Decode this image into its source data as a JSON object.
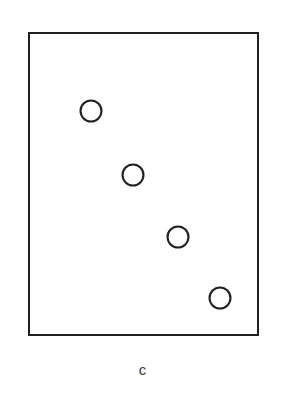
{
  "figure": {
    "panel_label": "c",
    "background_color": "#ffffff",
    "line_color": "#231f20",
    "marker_fill": "#ffffff",
    "label_color": "#3a3a3c",
    "canvas_width": 283,
    "canvas_height": 400
  },
  "frame": {
    "x": 29,
    "y": 33,
    "width": 229,
    "height": 302
  },
  "chart_data": {
    "type": "scatter",
    "title": "",
    "subtitle": "",
    "xlabel": "",
    "ylabel": "",
    "panel_label": "c",
    "grid": false,
    "legend": null,
    "axis_ticks": false,
    "tick_labels": {
      "x": [],
      "y": []
    },
    "xlim": [
      0,
      1
    ],
    "ylim": [
      0,
      1
    ],
    "marker": {
      "shape": "circle",
      "filled": false,
      "radius_px": 11.5,
      "edge_color": "#231f20",
      "face_color": "#ffffff",
      "edge_width_px": 2.1
    },
    "series": [
      {
        "name": "points",
        "points_px": [
          {
            "cx": 91,
            "cy": 111
          },
          {
            "cx": 133,
            "cy": 175
          },
          {
            "cx": 178,
            "cy": 237
          },
          {
            "cx": 220,
            "cy": 298
          }
        ],
        "x": [
          0.271,
          0.454,
          0.651,
          0.834
        ],
        "y": [
          0.742,
          0.53,
          0.325,
          0.123
        ]
      }
    ],
    "annotations": [
      {
        "text": "c",
        "position": "below-axes-center"
      }
    ]
  }
}
